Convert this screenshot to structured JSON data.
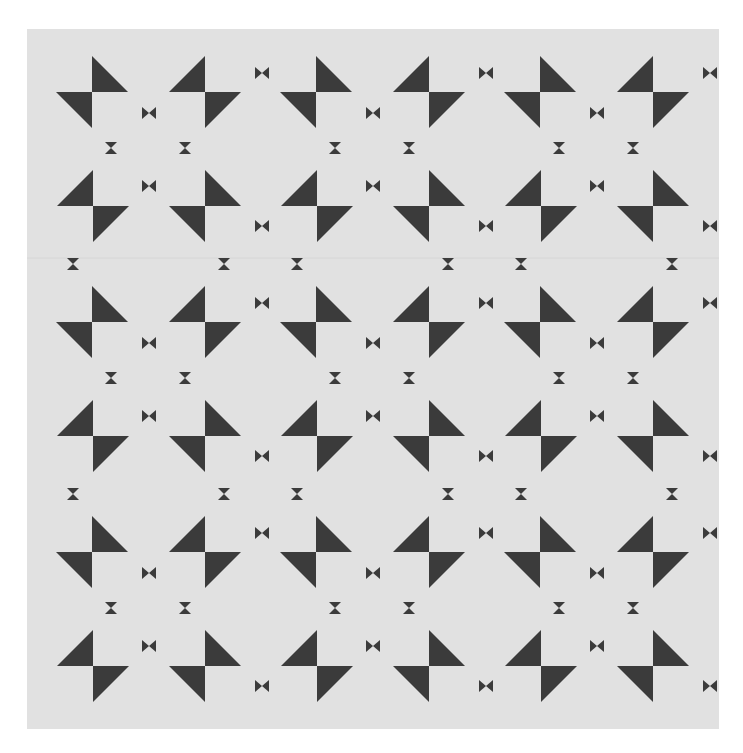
{
  "canvas": {
    "width": 743,
    "height": 753,
    "background": "#ffffff"
  },
  "panel": {
    "x": 27,
    "y": 29,
    "width": 692,
    "height": 700,
    "color": "#e1e1e1"
  },
  "shape_color": "#3b3b3b",
  "seams": [
    {
      "y": 258
    }
  ],
  "grid": {
    "origin_x": 0,
    "origin_y": 0,
    "cols": 3,
    "rows": 3,
    "pitch_x": 224,
    "pitch_y": 230
  },
  "block": {
    "pinwheel_size": 36,
    "pinwheels": [
      {
        "name": "pinwheel-top-left",
        "cx": 92,
        "cy": 92,
        "orientation": "a"
      },
      {
        "name": "pinwheel-top-right",
        "cx": 205,
        "cy": 92,
        "orientation": "b"
      },
      {
        "name": "pinwheel-bottom-left",
        "cx": 93,
        "cy": 206,
        "orientation": "b"
      },
      {
        "name": "pinwheel-bottom-right",
        "cx": 205,
        "cy": 206,
        "orientation": "a"
      }
    ],
    "bowties": [
      {
        "cx": 149,
        "cy": 113
      },
      {
        "cx": 149,
        "cy": 186
      },
      {
        "cx": 262,
        "cy": 73
      },
      {
        "cx": 262,
        "cy": 226
      }
    ],
    "hourglasses": [
      {
        "cx": 111,
        "cy": 148
      },
      {
        "cx": 185,
        "cy": 148
      },
      {
        "cx": 73,
        "cy": 264
      },
      {
        "cx": 224,
        "cy": 264
      }
    ],
    "small_size": 12
  }
}
